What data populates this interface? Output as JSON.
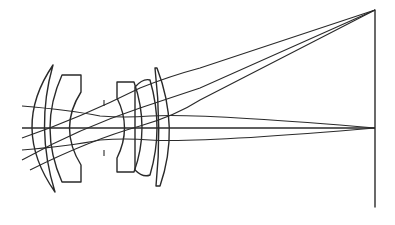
{
  "diagram": {
    "type": "optical-lens-layout",
    "title": "",
    "colors": {
      "background": "#ffffff",
      "line": "#2a2a2a"
    },
    "optical_axis": {
      "x1": 22,
      "y1": 128,
      "x2": 375,
      "y2": 128
    },
    "image_plane": {
      "x": 375,
      "y1": 10,
      "y2": 207
    },
    "lens_elements": [
      {
        "id": "element-1-meniscus",
        "path": "M53,65 Q10,128 55,192 Q35,128 53,65 Z"
      },
      {
        "id": "element-2-negative",
        "path": "M62,75 L81,75 L81,92 Q58,128 81,165 L81,182 L62,182 Q38,128 62,75 Z"
      },
      {
        "id": "element-3",
        "path": "M117,82 L134,82 Q150,128 134,172 L117,172 L117,158 Q132,128 117,98 Z"
      },
      {
        "id": "element-4",
        "path": "M135,87 Q143,78 150,80 Q164,128 150,175 Q143,178 135,170 Z"
      },
      {
        "id": "element-5",
        "path": "M157,68 Q180,128 160,186 L156,186 Q162,128 155,68 Z"
      }
    ],
    "rays": [
      {
        "id": "axial-upper",
        "path": "M22,106 Q70,110 100,116 Q125,118 150,116 Q200,113 375,128"
      },
      {
        "id": "axial-center",
        "path": "M22,128 L375,128"
      },
      {
        "id": "axial-lower",
        "path": "M22,150 Q70,146 100,140 Q125,138 150,140 Q200,143 375,128"
      },
      {
        "id": "field-upper",
        "path": "M22,138 Q80,118 140,88 Q170,76 200,68 L375,10"
      },
      {
        "id": "field-center",
        "path": "M22,160 Q80,128 140,108 Q170,98 200,88 L375,10"
      },
      {
        "id": "field-lower",
        "path": "M30,170 Q90,140 140,126 Q175,116 200,100 L375,10"
      }
    ],
    "aperture_ticks": [
      {
        "x": 104,
        "y1": 100,
        "y2": 106
      },
      {
        "x": 104,
        "y1": 150,
        "y2": 156
      }
    ]
  }
}
